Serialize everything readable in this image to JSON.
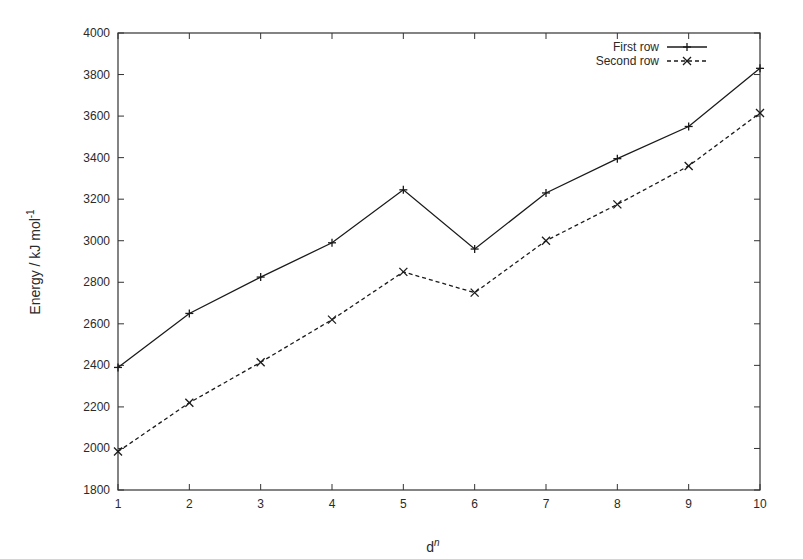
{
  "chart_data": {
    "type": "line",
    "title": "",
    "xlabel": "d",
    "xlabel_superscript": "n",
    "ylabel": "Energy / kJ mol",
    "ylabel_superscript": "-1",
    "x": [
      1,
      2,
      3,
      4,
      5,
      6,
      7,
      8,
      9,
      10
    ],
    "xlim": [
      1,
      10
    ],
    "ylim": [
      1800,
      4000
    ],
    "yticks": [
      1800,
      2000,
      2200,
      2400,
      2600,
      2800,
      3000,
      3200,
      3400,
      3600,
      3800,
      4000
    ],
    "xticks": [
      1,
      2,
      3,
      4,
      5,
      6,
      7,
      8,
      9,
      10
    ],
    "grid": false,
    "legend_position": "upper right",
    "series": [
      {
        "name": "First row",
        "style": "solid",
        "marker": "+",
        "values": [
          2390,
          2650,
          2825,
          2990,
          3245,
          2960,
          3230,
          3395,
          3550,
          3830
        ]
      },
      {
        "name": "Second row",
        "style": "dashed",
        "marker": "x",
        "values": [
          1985,
          2220,
          2415,
          2620,
          2850,
          2750,
          3000,
          3175,
          3360,
          3615
        ]
      }
    ]
  },
  "colors": {
    "line": "#1a1a1a",
    "frame": "#333333",
    "background": "#ffffff"
  }
}
